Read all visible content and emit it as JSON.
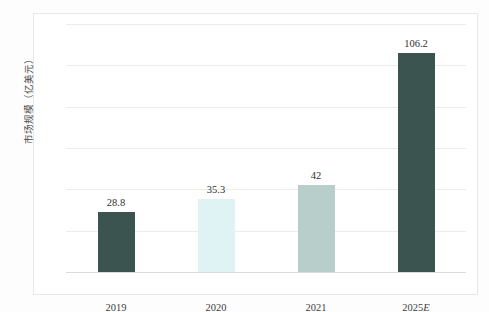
{
  "chart_data": {
    "type": "bar",
    "title": "",
    "subtitle": "",
    "xlabel": "",
    "ylabel": "市场规模（亿美元）",
    "categories": [
      "2019",
      "2020",
      "2021",
      "2025E"
    ],
    "values": [
      28.8,
      35.3,
      42,
      106.2
    ],
    "value_labels": [
      "28.8",
      "35.3",
      "42",
      "106.2"
    ],
    "ylim": [
      0,
      120
    ],
    "ytick_labels": [
      "0",
      "20",
      "40",
      "60",
      "80",
      "100",
      "120"
    ],
    "ytick_values": [
      0,
      20,
      40,
      60,
      80,
      100,
      120
    ],
    "grid": true,
    "legend": false,
    "bar_colors": [
      "#3c5450",
      "#dff2f4",
      "#b7cecb",
      "#3c5450"
    ],
    "series": [
      {
        "name": "市场规模",
        "values": [
          28.8,
          35.3,
          42,
          106.2
        ]
      }
    ]
  },
  "axis": {
    "y_title": "市场规模（亿美元）"
  },
  "colors": {
    "bar_dark": "#3c5450",
    "bar_light_cyan": "#dff2f4",
    "bar_celadon": "#b7cecb",
    "gridline": "#ececeb",
    "frame": "#e8e8e6",
    "text": "#3d3d3d"
  }
}
